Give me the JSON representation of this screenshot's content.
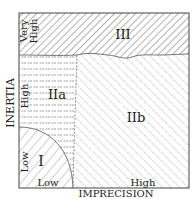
{
  "diagram": {
    "x_axis_label": "IMPRECISION",
    "y_axis_label": "INERTIA",
    "x_ticks": {
      "low": "Low",
      "high": "High"
    },
    "y_ticks": {
      "low": "Low",
      "high": "High",
      "very_high": "Very High"
    },
    "y_tick_very_line1": "Very",
    "y_tick_very_line2": "High",
    "regions": [
      {
        "id": "I",
        "label": "I",
        "hatch": "diagonal-forward"
      },
      {
        "id": "IIa",
        "label": "IIa",
        "hatch": "horizontal-dashed"
      },
      {
        "id": "IIb",
        "label": "IIb",
        "hatch": "diagonal-back"
      },
      {
        "id": "III",
        "label": "III",
        "hatch": "diagonal-forward-dense"
      }
    ],
    "colors": {
      "line": "#444444",
      "hatch": "#666666",
      "background": "#ffffff"
    }
  }
}
